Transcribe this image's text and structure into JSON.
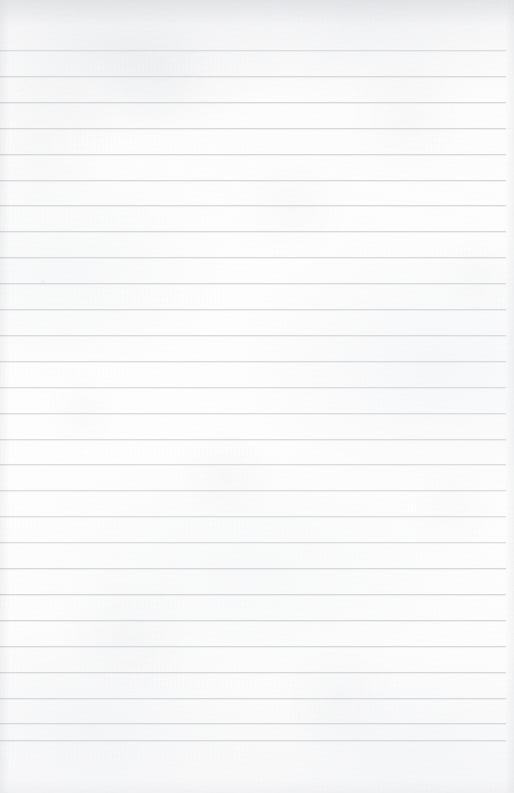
{
  "document": {
    "kind": "scanned-ruled-paper",
    "title": "Blank Ruled Notebook Page",
    "page_width": 514,
    "page_height": 793,
    "content_text": "",
    "is_blank": true
  },
  "paper": {
    "background_color": "#fdfdfd",
    "edge_shadow_color": "#e1e2e5",
    "texture": "fine fibre grain with light scan mottling"
  },
  "ruling": {
    "line_color": "#d7d8dc",
    "line_thickness_px": 1,
    "line_spacing_px": 25.9,
    "first_line_y": 50,
    "line_left_x": 0,
    "line_right_x": 506,
    "line_count": 27,
    "line_positions": [
      50,
      75.9,
      101.8,
      127.7,
      153.6,
      179.5,
      205.4,
      231.3,
      257.2,
      283.1,
      309.0,
      334.9,
      360.8,
      386.7,
      412.6,
      438.5,
      464.4,
      490.3,
      516.2,
      542.1,
      568.0,
      593.9,
      619.8,
      645.7,
      671.6,
      697.5,
      723.4,
      740.0
    ]
  },
  "blemishes": [
    {
      "x": 42,
      "y": 281,
      "size": 5,
      "color": "#e3e4e7",
      "opacity": 0.55
    },
    {
      "x": 78,
      "y": 11,
      "size": 4,
      "color": "#e6e7ea",
      "opacity": 0.45
    },
    {
      "x": 336,
      "y": 6,
      "size": 3,
      "color": "#e8e9ec",
      "opacity": 0.4
    },
    {
      "x": 463,
      "y": 446,
      "size": 3,
      "color": "#ebecef",
      "opacity": 0.35
    }
  ]
}
